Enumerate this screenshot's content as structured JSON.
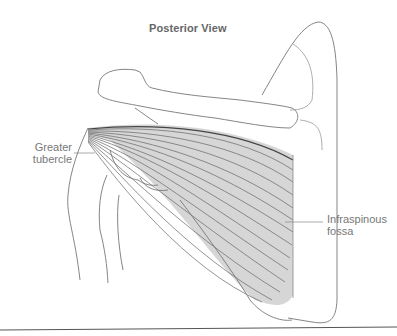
{
  "figure": {
    "title": "Posterior View",
    "labels": [
      {
        "id": "greater-tubercle",
        "text": "Greater\ntubercle"
      },
      {
        "id": "infraspinous-fossa",
        "text": "Infraspinous\nfossa"
      }
    ],
    "colors": {
      "outline": "#777777",
      "muscle_fill": "#d4d4d4",
      "fiber_line": "#666666",
      "label_text": "#777777",
      "leader_line": "#888888",
      "bottom_rule": "#555555"
    }
  }
}
